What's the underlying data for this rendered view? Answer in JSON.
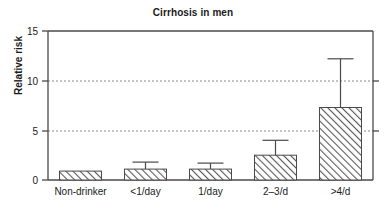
{
  "chart_data": {
    "type": "bar",
    "title": "Cirrhosis in men",
    "xlabel": "",
    "ylabel": "Relative risk",
    "categories": [
      "Non-drinker",
      "<1/day",
      "1/day",
      "2–3/d",
      ">4/d"
    ],
    "values": [
      0.9,
      1.1,
      1.1,
      2.5,
      7.3
    ],
    "error_high": [
      null,
      1.8,
      1.7,
      4.0,
      12.2
    ],
    "ylim": [
      0,
      15
    ],
    "yticks": [
      0,
      5,
      10,
      15
    ],
    "ytick_labels": [
      "0",
      "5",
      "10",
      "15"
    ],
    "grid": "horizontal-dashed",
    "legend": "none",
    "bar_fill": "diagonal-hatch",
    "bar_color": "#4d4d4d",
    "axis_color": "#4a4a4a"
  }
}
